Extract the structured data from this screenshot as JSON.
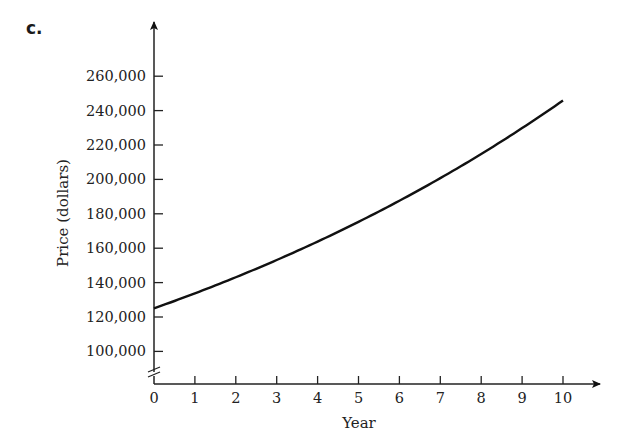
{
  "part_label": "c.",
  "chart_data": {
    "type": "line",
    "title": "",
    "xlabel": "Year",
    "ylabel": "Price (dollars)",
    "x": [
      0,
      1,
      2,
      3,
      4,
      5,
      6,
      7,
      8,
      9,
      10
    ],
    "series": [
      {
        "name": "Price",
        "values": [
          125000,
          133750,
          143100,
          153100,
          163900,
          175300,
          187600,
          200700,
          214800,
          229800,
          245900
        ]
      }
    ],
    "xticks": [
      "0",
      "1",
      "2",
      "3",
      "4",
      "5",
      "6",
      "7",
      "8",
      "9",
      "10"
    ],
    "yticks": [
      "100,000",
      "120,000",
      "140,000",
      "160,000",
      "180,000",
      "200,000",
      "220,000",
      "240,000",
      "260,000"
    ],
    "ytick_values": [
      100000,
      120000,
      140000,
      160000,
      180000,
      200000,
      220000,
      240000,
      260000
    ],
    "xlim": [
      0,
      10
    ],
    "ylim": [
      80000,
      270000
    ],
    "y_axis_break": true,
    "grid": false,
    "legend": false
  }
}
